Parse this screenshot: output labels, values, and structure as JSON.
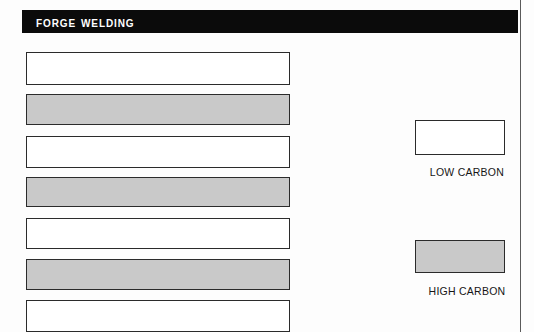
{
  "page": {
    "background_color": "#fdfdfd",
    "margin_rule_color": "#5a5a5a"
  },
  "header": {
    "title": "Forge Welding",
    "background_color": "#0b0b0b",
    "text_color": "#ffffff"
  },
  "legend": {
    "items": [
      {
        "label": "LOW CARBON",
        "swatch": "white",
        "color": "#ffffff"
      },
      {
        "label": "HIGH CARBON",
        "swatch": "gray",
        "color": "#c9c9c9"
      }
    ]
  },
  "chart_data": {
    "type": "bar",
    "orientation": "horizontal",
    "title": "Forge Welding",
    "xlabel": "",
    "ylabel": "",
    "grid": false,
    "legend_position": "right",
    "colors": {
      "low_carbon": "#ffffff",
      "high_carbon": "#c9c9c9"
    },
    "categories": [
      "1",
      "2",
      "3",
      "4",
      "5",
      "6",
      "7"
    ],
    "series": [
      {
        "name": "LOW CARBON",
        "color": "#ffffff",
        "values": [
          100,
          null,
          100,
          null,
          100,
          null,
          100
        ]
      },
      {
        "name": "HIGH CARBON",
        "color": "#c9c9c9",
        "values": [
          null,
          100,
          null,
          100,
          null,
          100,
          null
        ]
      }
    ],
    "bars": [
      {
        "index": 1,
        "series": "LOW CARBON",
        "value": 100,
        "x": 26,
        "y": 52,
        "width": 264,
        "height": 33
      },
      {
        "index": 2,
        "series": "HIGH CARBON",
        "value": 100,
        "x": 26,
        "y": 94,
        "width": 264,
        "height": 31
      },
      {
        "index": 3,
        "series": "LOW CARBON",
        "value": 100,
        "x": 26,
        "y": 136,
        "width": 264,
        "height": 32
      },
      {
        "index": 4,
        "series": "HIGH CARBON",
        "value": 100,
        "x": 26,
        "y": 177,
        "width": 264,
        "height": 30
      },
      {
        "index": 5,
        "series": "LOW CARBON",
        "value": 100,
        "x": 26,
        "y": 218,
        "width": 264,
        "height": 31
      },
      {
        "index": 6,
        "series": "HIGH CARBON",
        "value": 100,
        "x": 26,
        "y": 259,
        "width": 264,
        "height": 31
      },
      {
        "index": 7,
        "series": "LOW CARBON",
        "value": 100,
        "x": 26,
        "y": 300,
        "width": 264,
        "height": 32
      }
    ]
  }
}
